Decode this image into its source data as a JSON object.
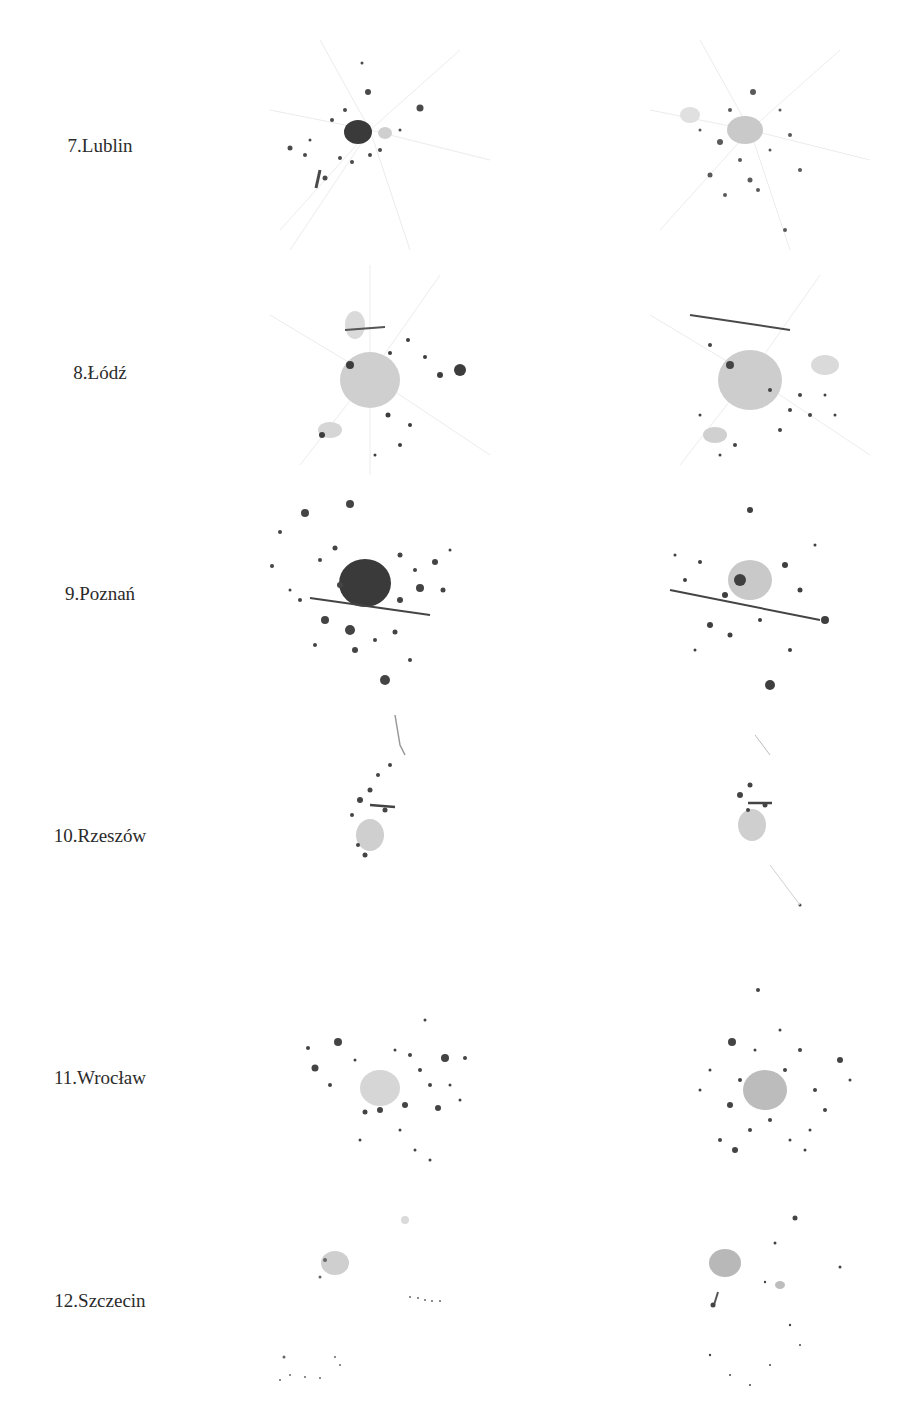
{
  "figure": {
    "rows": [
      {
        "label": "7.Lublin",
        "left_map": "Lublin urban area – period A",
        "right_map": "Lublin urban area – period B"
      },
      {
        "label": "8.Łódź",
        "left_map": "Łódź urban area – period A",
        "right_map": "Łódź urban area – period B"
      },
      {
        "label": "9.Poznań",
        "left_map": "Poznań urban area – period A",
        "right_map": "Poznań urban area – period B"
      },
      {
        "label": "10.Rzeszów",
        "left_map": "Rzeszów urban area – period A",
        "right_map": "Rzeszów urban area – period B"
      },
      {
        "label": "11.Wrocław",
        "left_map": "Wrocław urban area – period A",
        "right_map": "Wrocław urban area – period B"
      },
      {
        "label": "12.Szczecin",
        "left_map": "Szczecin urban area – period A",
        "right_map": "Szczecin urban area – period B"
      }
    ]
  },
  "colors": {
    "dark": "#3a3a3a",
    "mid": "#8a8a8a",
    "light": "#c9c9c9",
    "faint": "#e6e6e6",
    "background": "#ffffff"
  }
}
